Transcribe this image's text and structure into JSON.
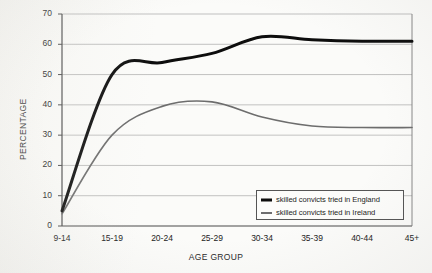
{
  "chart_data": {
    "type": "line",
    "title": "",
    "xlabel": "AGE GROUP",
    "ylabel": "PERCENTAGE",
    "categories": [
      "9-14",
      "15-19",
      "20-24",
      "25-29",
      "30-34",
      "35-39",
      "40-44",
      "45+"
    ],
    "ylim": [
      0,
      70
    ],
    "yticks": [
      0,
      10,
      20,
      30,
      40,
      50,
      60,
      70
    ],
    "grid": "horizontal",
    "legend_position": "bottom-right",
    "series": [
      {
        "name": "skilled convicts tried in England",
        "color": "#0d0d0d",
        "line_width": 3,
        "values": [
          5,
          50,
          54,
          57,
          62.5,
          61.5,
          61,
          61
        ]
      },
      {
        "name": "skilled convicts tried in Ireland",
        "color": "#6d6d6d",
        "line_width": 1.6,
        "values": [
          4,
          30,
          39.5,
          41,
          36,
          33,
          32.5,
          32.5
        ]
      }
    ]
  },
  "legend": {
    "items": [
      {
        "label": "skilled convicts tried in England",
        "marker": "line-swatch-black"
      },
      {
        "label": "skilled convicts tried in Ireland",
        "marker": "line-swatch-gray"
      }
    ]
  },
  "axes": {
    "y_title": "PERCENTAGE",
    "x_title": "AGE GROUP",
    "y_tick_labels": [
      "70",
      "60",
      "50",
      "40",
      "30",
      "20",
      "10",
      "0"
    ],
    "x_tick_labels": [
      "9-14",
      "15-19",
      "20-24",
      "25-29",
      "30-34",
      "35-39",
      "40-44",
      "45+"
    ]
  },
  "colors": {
    "background": "#fbfbf9",
    "axis": "#4a4a4a",
    "grid": "#a8a8a8",
    "series_england": "#0d0d0d",
    "series_ireland": "#6d6d6d"
  }
}
